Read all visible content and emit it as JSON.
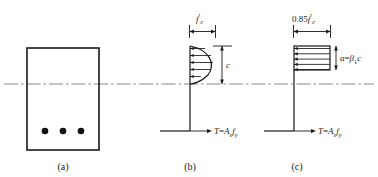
{
  "figure": {
    "background": "#ffffff",
    "line_color": "#1a1a1a",
    "centerline_color": "#7a7a7a",
    "panels": [
      {
        "id": "a",
        "caption": "(a)",
        "description": "beam cross-section with tension reinforcement",
        "rebar_count": 3
      },
      {
        "id": "b",
        "caption": "(b)",
        "description": "actual parabolic compressive stress distribution",
        "stress_label": "f'c",
        "stress_label_parts": {
          "base": "f",
          "prime": "′",
          "sub": "c"
        },
        "depth_label": "c",
        "force_label": "T=Asfy",
        "force_label_parts": {
          "t": "T",
          "eq": "=",
          "a": "A",
          "a_sub": "s",
          "f": "f",
          "f_sub": "y"
        },
        "arrow_count": 5
      },
      {
        "id": "c",
        "caption": "(c)",
        "description": "equivalent rectangular (Whitney) stress block",
        "stress_label": "0.85f'c",
        "stress_label_parts": {
          "coef": "0.85",
          "base": "f",
          "prime": "′",
          "sub": "c"
        },
        "depth_label": "a=β1c",
        "depth_label_parts": {
          "a": "a",
          "eq": "=",
          "beta": "β",
          "beta_sub": "1",
          "c": "c"
        },
        "force_label": "T=Asfy",
        "force_label_parts": {
          "t": "T",
          "eq": "=",
          "a": "A",
          "a_sub": "s",
          "f": "f",
          "f_sub": "y"
        },
        "arrow_count": 5
      }
    ]
  }
}
